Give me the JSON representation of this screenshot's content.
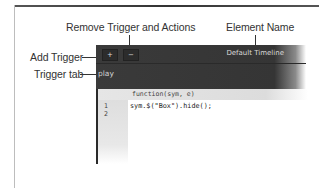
{
  "callouts": {
    "remove_trigger": "Remove Trigger and Actions",
    "element_name": "Element Name",
    "add_trigger": "Add Trigger",
    "trigger_tab": "Trigger tab"
  },
  "panel": {
    "add_button": "+",
    "remove_button": "−",
    "element_name": "Default Timeline",
    "trigger_tab": "play"
  },
  "code": {
    "header": "function(sym, e)",
    "lines": [
      {
        "num": "1",
        "text": "sym.$(\"Box\").hide();"
      },
      {
        "num": "2",
        "text": ""
      }
    ]
  }
}
